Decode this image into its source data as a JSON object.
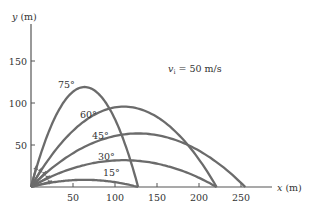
{
  "chart_data": {
    "type": "line",
    "title": "",
    "annotation": "v_i = 50 m/s",
    "xlabel": "x (m)",
    "ylabel": "y (m)",
    "xlim": [
      0,
      290
    ],
    "ylim": [
      0,
      190
    ],
    "xticks": [
      50,
      100,
      150,
      200,
      250
    ],
    "yticks": [
      50,
      100,
      150
    ],
    "grid": false,
    "legend": "none",
    "initial_speed": 50,
    "g": 9.8,
    "series": [
      {
        "name": "75°",
        "angle": 75,
        "range": 127.6,
        "max_height": 119.0
      },
      {
        "name": "60°",
        "angle": 60,
        "range": 220.9,
        "max_height": 95.7
      },
      {
        "name": "45°",
        "angle": 45,
        "range": 255.1,
        "max_height": 63.8
      },
      {
        "name": "30°",
        "angle": 30,
        "range": 220.9,
        "max_height": 31.9
      },
      {
        "name": "15°",
        "angle": 15,
        "range": 127.6,
        "max_height": 8.5
      }
    ]
  },
  "colors": {
    "curve": "#6b6b6b",
    "axis": "#555555",
    "text": "#333333"
  }
}
